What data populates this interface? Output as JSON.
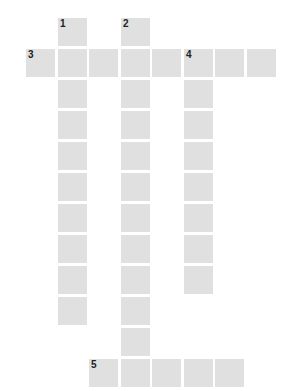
{
  "puzzle": {
    "type": "crossword",
    "cell_color": "#e0e0e0",
    "number_color": "#222222",
    "origin": {
      "x": 26,
      "y": 18
    },
    "pitch": {
      "x": 31.5,
      "y": 31
    },
    "clues": [
      {
        "number": "1",
        "direction": "down",
        "row": 0,
        "col": 1,
        "length": 10
      },
      {
        "number": "2",
        "direction": "down",
        "row": 0,
        "col": 3,
        "length": 12
      },
      {
        "number": "3",
        "direction": "across",
        "row": 1,
        "col": 0,
        "length": 8
      },
      {
        "number": "4",
        "direction": "down",
        "row": 1,
        "col": 5,
        "length": 8
      },
      {
        "number": "5",
        "direction": "across",
        "row": 11,
        "col": 2,
        "length": 5
      }
    ]
  }
}
